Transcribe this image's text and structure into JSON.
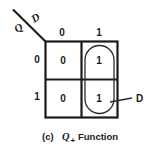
{
  "diagram": {
    "type": "karnaugh-map",
    "size": "2x2",
    "axes": {
      "row_variable": "Q",
      "column_variable": "D",
      "column_headers": [
        "0",
        "1"
      ],
      "row_headers": [
        "0",
        "1"
      ]
    },
    "cells": [
      {
        "row": "0",
        "col": "0",
        "value": "0"
      },
      {
        "row": "0",
        "col": "1",
        "value": "1"
      },
      {
        "row": "1",
        "col": "0",
        "value": "0"
      },
      {
        "row": "1",
        "col": "1",
        "value": "1"
      }
    ],
    "groupings": [
      {
        "label": "D",
        "covers": "right-column",
        "shape": "rounded-oval"
      }
    ],
    "caption": {
      "index": "(c)",
      "variable": "Q",
      "subscript": "+",
      "text": "Function"
    },
    "colors": {
      "ink": "#1a1a1a",
      "background": "#ffffff",
      "grouping": "#3a3a3a"
    }
  }
}
